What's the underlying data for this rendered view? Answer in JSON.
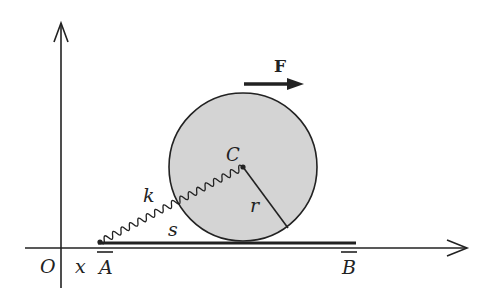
{
  "figure": {
    "labels": {
      "force": "F",
      "center": "C",
      "spring_constant": "k",
      "radius": "r",
      "arc_length": "s",
      "origin": "O",
      "position": "x",
      "point_a": "A",
      "point_b": "B"
    },
    "colors": {
      "disk_fill": "#d4d4d4",
      "stroke": "#222222",
      "background": "#ffffff"
    }
  }
}
